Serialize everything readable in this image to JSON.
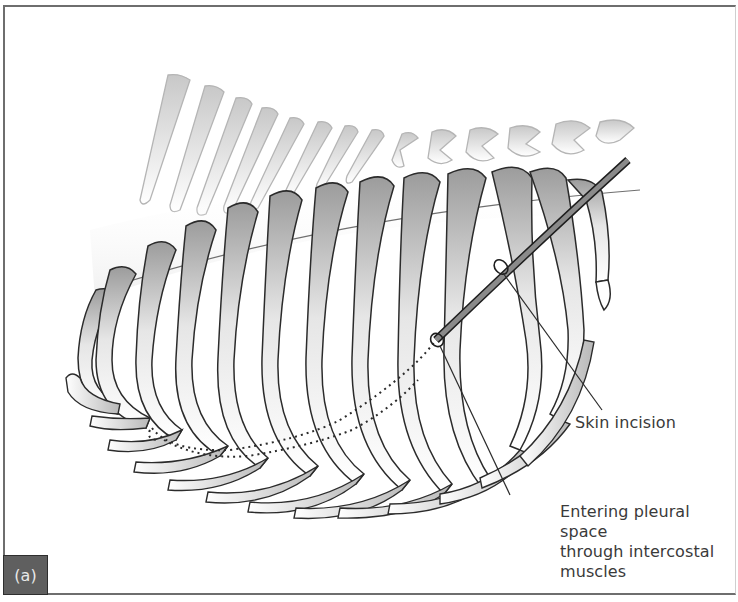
{
  "figure": {
    "panel_label": "(a)",
    "annotations": [
      {
        "id": "skin-incision",
        "text": "Skin incision"
      },
      {
        "id": "pleural-entry",
        "lines": [
          "Entering pleural space",
          "through intercostal muscles"
        ]
      }
    ],
    "colors": {
      "outline": "#2b2b2b",
      "rib_shade": "#a8a8a8",
      "tube_fill": "#8a8a8a",
      "spine_outline": "#b5b5b5",
      "text": "#3a3a3a",
      "panel_tag_bg": "#5f5f5f",
      "border": "#6e6e6e"
    }
  }
}
